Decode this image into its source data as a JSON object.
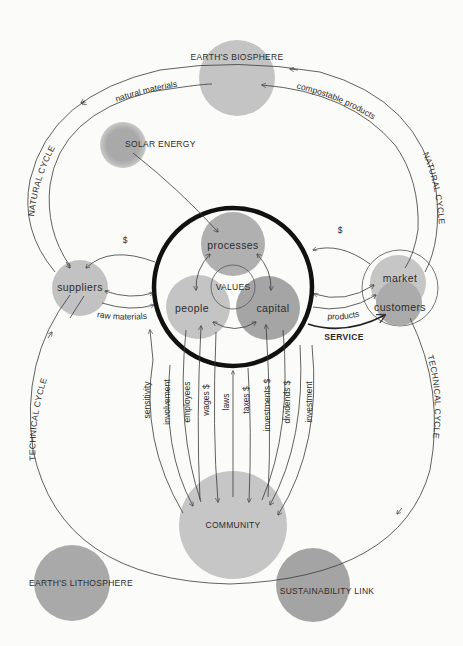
{
  "diagram": {
    "nodes": {
      "biosphere": "EARTH'S BIOSPHERE",
      "solar": "SOLAR ENERGY",
      "processes": "processes",
      "people": "people",
      "capital": "capital",
      "values": "VALUES",
      "suppliers": "suppliers",
      "market": "market",
      "customers": "customers",
      "community": "COMMUNITY",
      "lithosphere": "EARTH'S LITHOSPHERE",
      "sustainability": "SUSTAINABILITY LINK"
    },
    "cycles": {
      "natural_left": "NATURAL CYCLE",
      "natural_right": "NATURAL CYCLE",
      "technical_left": "TECHNICAL CYCLE",
      "technical_right": "TECHNICAL CYCLE"
    },
    "flows": {
      "natural_materials": "natural materials",
      "compostable_products": "compostable products",
      "dollar_left": "$",
      "dollar_right": "$",
      "raw_materials": "raw materials",
      "products": "products",
      "service": "SERVICE"
    },
    "community_flows": [
      "sensitivity",
      "involvement",
      "employees",
      "wages $",
      "laws",
      "taxes $",
      "investments $",
      "dividends $",
      "investment"
    ],
    "colors": {
      "light_circle": "#c4c4c4",
      "mid_circle": "#b3b3b3",
      "dark_circle": "#a4a4a4",
      "ring": "#111111",
      "line": "#3a3a3a",
      "background": "#fbfbf9"
    }
  }
}
